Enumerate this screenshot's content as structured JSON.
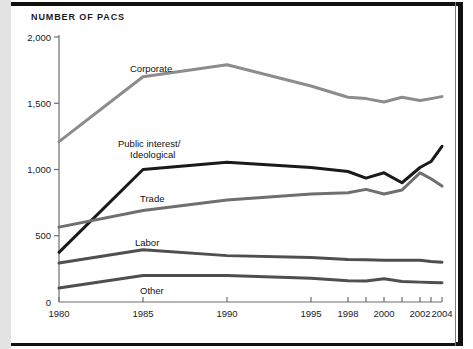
{
  "figure": {
    "title": "NUMBER OF PACS"
  },
  "chart_data": {
    "type": "line",
    "title": "NUMBER OF PACS",
    "xlabel": "",
    "ylabel": "Number of PACs",
    "ylim": [
      0,
      2000
    ],
    "yticks": [
      0,
      500,
      1000,
      1500,
      2000
    ],
    "ytick_labels": [
      "0",
      "500",
      "1,000",
      "1,500",
      "2,000"
    ],
    "x": [
      1980,
      1985,
      1990,
      1995,
      1998,
      1999,
      2000,
      2001,
      2002,
      2003,
      2004
    ],
    "xtick_labels": [
      "1980",
      "1985",
      "1990",
      "1995",
      "1998",
      "2000",
      "2002",
      "2004"
    ],
    "xtick_values": [
      1980,
      1985,
      1990,
      1995,
      1998,
      2000,
      2002,
      2004
    ],
    "minor_xticks": [
      1999,
      2001,
      2003
    ],
    "grid": false,
    "legend_position": "inline-labels",
    "series": [
      {
        "name": "Corporate",
        "color": "#8c8c8c",
        "values": [
          1210,
          1700,
          1790,
          1630,
          1545,
          1535,
          1510,
          1545,
          1520,
          1535,
          1550
        ]
      },
      {
        "name": "Public interest/\nIdeological",
        "label_line1": "Public interest/",
        "label_line2": "Ideological",
        "color": "#1a1a1a",
        "values": [
          375,
          1000,
          1055,
          1015,
          985,
          935,
          975,
          900,
          1015,
          1060,
          1175
        ]
      },
      {
        "name": "Trade",
        "color": "#6f6f6f",
        "values": [
          565,
          690,
          770,
          815,
          825,
          850,
          815,
          845,
          975,
          930,
          875
        ]
      },
      {
        "name": "Labor",
        "color": "#4f4f4f",
        "values": [
          295,
          395,
          350,
          335,
          320,
          318,
          315,
          315,
          315,
          305,
          300
        ]
      },
      {
        "name": "Other",
        "color": "#4f4f4f",
        "values": [
          105,
          200,
          200,
          180,
          160,
          158,
          175,
          155,
          150,
          148,
          145
        ]
      }
    ]
  },
  "series_labels": {
    "corporate": "Corporate",
    "public_interest_line1": "Public interest/",
    "public_interest_line2": "Ideological",
    "trade": "Trade",
    "labor": "Labor",
    "other": "Other"
  }
}
